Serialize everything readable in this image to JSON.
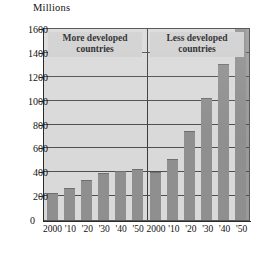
{
  "chart_data": {
    "type": "bar",
    "title": "",
    "ylabel": "Millions",
    "xlabel": "",
    "ylim": [
      0,
      1600
    ],
    "yticks": [
      0,
      200,
      400,
      600,
      800,
      1000,
      1200,
      1400,
      1600
    ],
    "ytick_labels": [
      "0",
      "200",
      "400",
      "600",
      "800",
      "1000",
      "1200",
      "1400",
      "1600"
    ],
    "grid": true,
    "legend": "none",
    "categories": [
      "2000",
      "'10",
      "'20",
      "'30",
      "'40",
      "'50"
    ],
    "panels": [
      {
        "name": "more-developed",
        "caption": "More developed countries",
        "categories": [
          "2000",
          "'10",
          "'20",
          "'30",
          "'40",
          "'50"
        ],
        "values": [
          225,
          270,
          335,
          395,
          410,
          425
        ]
      },
      {
        "name": "less-developed",
        "caption": "Less developed countries",
        "categories": [
          "2000",
          "'10",
          "'20",
          "'30",
          "'40",
          "'50"
        ],
        "values": [
          405,
          515,
          745,
          1020,
          1305,
          1600
        ]
      }
    ],
    "series": [
      {
        "name": "More developed countries",
        "values": [
          225,
          270,
          335,
          395,
          410,
          425
        ]
      },
      {
        "name": "Less developed countries",
        "values": [
          405,
          515,
          745,
          1020,
          1305,
          1600
        ]
      }
    ],
    "colors": {
      "bar": "#8f8f8f",
      "plot_background": "#d9d9d9",
      "gridline": "#4f4f4f",
      "axis": "#2b2b2b",
      "caption_background": "#cfcfcf"
    }
  }
}
